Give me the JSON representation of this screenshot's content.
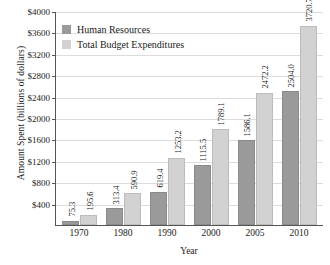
{
  "chart_data": {
    "type": "bar",
    "title": "",
    "xlabel": "Year",
    "ylabel": "Amount Spent (billions of dollars)",
    "categories": [
      "1970",
      "1980",
      "1990",
      "2000",
      "2005",
      "2010"
    ],
    "series": [
      {
        "name": "Human Resources",
        "color": "#9a9a9a",
        "values": [
          75.3,
          313.4,
          619.4,
          1115.5,
          1586.1,
          2504.0
        ],
        "labels": [
          "75.3",
          "313.4",
          "619.4",
          "1115.5",
          "1586.1",
          "2504.0"
        ]
      },
      {
        "name": "Total Budget Expenditures",
        "color": "#d2d2d2",
        "values": [
          195.6,
          590.9,
          1253.2,
          1789.1,
          2472.2,
          3720.7
        ],
        "labels": [
          "195.6",
          "590.9",
          "1253.2",
          "1789.1",
          "2472.2",
          "3720.7"
        ]
      }
    ],
    "ylim": [
      0,
      4000
    ],
    "ytick_step": 400,
    "yticks": [
      400,
      800,
      1200,
      1600,
      2000,
      2400,
      2800,
      3200,
      3600,
      4000
    ],
    "ytick_labels": [
      "$400",
      "$800",
      "$1200",
      "$1600",
      "$2000",
      "$2400",
      "$2800",
      "$3200",
      "$3600",
      "$4000"
    ],
    "grid": true,
    "legend_position": "top-left"
  },
  "legend": {
    "items": [
      {
        "label": "Human Resources",
        "color": "#9a9a9a"
      },
      {
        "label": "Total Budget Expenditures",
        "color": "#d2d2d2"
      }
    ]
  }
}
